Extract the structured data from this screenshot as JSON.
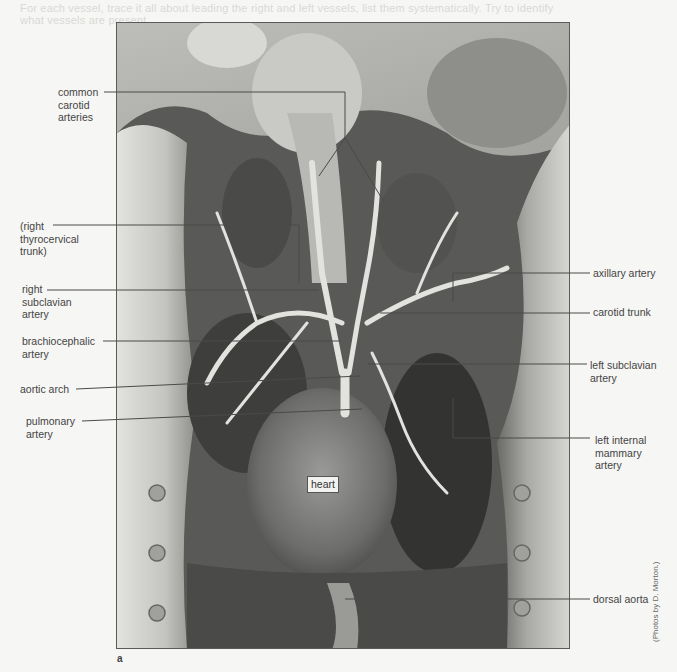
{
  "figure": {
    "panel_letter": "a",
    "photo_credit": "(Photos by D. Morton.)",
    "bleed_through_lines": [
      "For each vessel, trace it all about leading the right and left vessels, list them systematically. Try to identify",
      "what vessels are present."
    ],
    "center_label": "heart",
    "labels_left": [
      {
        "id": "common-carotid-arteries",
        "text": "common\ncarotid\narteries",
        "x": 58,
        "y": 86
      },
      {
        "id": "right-thyrocervical-trunk",
        "text": "(right\nthyrocervical\ntrunk)",
        "x": 20,
        "y": 220
      },
      {
        "id": "right-subclavian-artery",
        "text": "right\nsubclavian\nartery",
        "x": 22,
        "y": 283
      },
      {
        "id": "brachiocephalic-artery",
        "text": "brachiocephalic\nartery",
        "x": 22,
        "y": 335
      },
      {
        "id": "aortic-arch",
        "text": "aortic arch",
        "x": 20,
        "y": 383
      },
      {
        "id": "pulmonary-artery",
        "text": "pulmonary\nartery",
        "x": 26,
        "y": 415
      }
    ],
    "labels_right": [
      {
        "id": "axillary-artery",
        "text": "axillary artery",
        "x": 593,
        "y": 267
      },
      {
        "id": "carotid-trunk",
        "text": "carotid trunk",
        "x": 593,
        "y": 306
      },
      {
        "id": "left-subclavian-artery",
        "text": "left subclavian\nartery",
        "x": 590,
        "y": 359
      },
      {
        "id": "left-internal-mammary-artery",
        "text": "left internal\nmammary\nartery",
        "x": 595,
        "y": 434
      },
      {
        "id": "dorsal-aorta",
        "text": "dorsal aorta",
        "x": 593,
        "y": 593
      }
    ]
  },
  "leader_lines": [
    {
      "for": "common-carotid-arteries",
      "points": "104,92 345,92 345,138 319,176"
    },
    {
      "for": "common-carotid-arteries-b",
      "points": "345,138 384,202"
    },
    {
      "for": "right-thyrocervical-trunk",
      "points": "53,225 299,225 299,283"
    },
    {
      "for": "right-subclavian-artery",
      "points": "47,290 319,290"
    },
    {
      "for": "brachiocephalic-artery",
      "points": "103,341 341,341"
    },
    {
      "for": "aortic-arch",
      "points": "76,389 360,376"
    },
    {
      "for": "pulmonary-artery",
      "points": "82,421 362,409"
    },
    {
      "for": "axillary-artery",
      "points": "590,273 453,273 453,302"
    },
    {
      "for": "carotid-trunk",
      "points": "590,313 380,313"
    },
    {
      "for": "left-subclavian-artery",
      "points": "587,364 368,364"
    },
    {
      "for": "left-internal-mammary-artery",
      "points": "590,438 453,438 453,398"
    },
    {
      "for": "dorsal-aorta",
      "points": "590,599 345,599"
    }
  ]
}
